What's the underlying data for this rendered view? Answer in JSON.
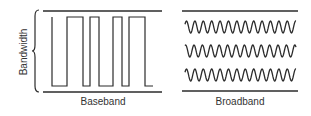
{
  "diagram": {
    "axis_label": "Bandwidth",
    "panels": [
      {
        "id": "baseband",
        "label": "Baseband",
        "signal": "square-wave (single digital signal occupying full bandwidth)"
      },
      {
        "id": "broadband",
        "label": "Broadband",
        "signal": "three parallel analog sine-wave channels"
      }
    ],
    "colors": {
      "stroke": "#2b2b2b",
      "text": "#333333",
      "background": "#ffffff"
    }
  }
}
